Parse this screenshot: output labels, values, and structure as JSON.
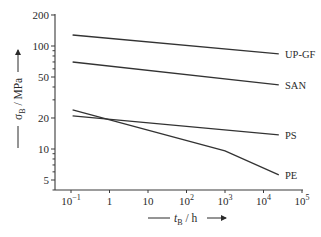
{
  "chart_data": {
    "type": "line",
    "title": "",
    "xlabel": "t_B / h",
    "ylabel": "σ_B / MPa",
    "xscale": "log",
    "yscale": "log",
    "xlim": [
      0.1,
      100000
    ],
    "ylim": [
      3.8,
      200
    ],
    "grid": false,
    "legend": "inline labels at right end of each line",
    "x_ticks": [
      {
        "value": 0.1,
        "label": "10",
        "sup": "−1"
      },
      {
        "value": 1,
        "label": "1",
        "sup": ""
      },
      {
        "value": 10,
        "label": "10",
        "sup": ""
      },
      {
        "value": 100,
        "label": "10",
        "sup": "2"
      },
      {
        "value": 1000,
        "label": "10",
        "sup": "3"
      },
      {
        "value": 10000,
        "label": "10",
        "sup": "4"
      },
      {
        "value": 100000,
        "label": "10",
        "sup": "5"
      }
    ],
    "y_ticks": [
      {
        "value": 200,
        "label": "200"
      },
      {
        "value": 100,
        "label": "100"
      },
      {
        "value": 50,
        "label": "50"
      },
      {
        "value": 20,
        "label": "20"
      },
      {
        "value": 10,
        "label": "10"
      },
      {
        "value": 5,
        "label": "5"
      }
    ],
    "y_minor_ticks": [
      90,
      80,
      70,
      60,
      40,
      30,
      9,
      8,
      7,
      6,
      4
    ],
    "series": [
      {
        "name": "UP-GF",
        "points": [
          [
            0.11,
            128
          ],
          [
            25000,
            84
          ]
        ]
      },
      {
        "name": "SAN",
        "points": [
          [
            0.11,
            70
          ],
          [
            25000,
            42
          ]
        ]
      },
      {
        "name": "PS",
        "points": [
          [
            0.11,
            21
          ],
          [
            25000,
            13.7
          ]
        ]
      },
      {
        "name": "PE",
        "points": [
          [
            0.11,
            24
          ],
          [
            1000,
            9.6
          ],
          [
            25000,
            5.6
          ]
        ]
      }
    ]
  },
  "labels": {
    "x_axis": {
      "main": "t",
      "sub": "B",
      "unit": " / h"
    },
    "y_axis": {
      "main": "σ",
      "sub": "B",
      "unit": " / MPa"
    }
  }
}
